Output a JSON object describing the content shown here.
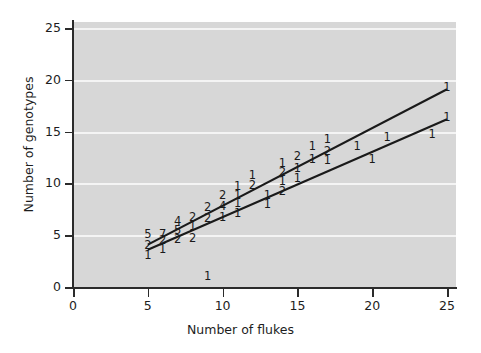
{
  "chart_data": {
    "type": "scatter",
    "title": "",
    "xlabel": "Number of flukes",
    "ylabel": "Number of genotypes",
    "xlim": [
      0,
      25.6
    ],
    "ylim": [
      0,
      25.6
    ],
    "xticks": [
      "0",
      "5",
      "10",
      "15",
      "20",
      "25"
    ],
    "yticks": [
      "0",
      "5",
      "10",
      "15",
      "20",
      "25"
    ],
    "xtick_values": [
      0,
      5,
      10,
      15,
      20,
      25
    ],
    "ytick_values": [
      0,
      5,
      10,
      15,
      20,
      25
    ],
    "grid": "horizontal-white-gridlines",
    "legend": "none",
    "panel_color": "#d7d7d7",
    "gridline_color": "#f4f4f4",
    "line_color": "#1a1a1a",
    "marker_style": "digit-count-labels",
    "note": "Each plotted marker is a digit giving the number of overlapping observations at that coordinate.",
    "points": [
      {
        "x": 5,
        "y": 5,
        "label": "5"
      },
      {
        "x": 5,
        "y": 4,
        "label": "2"
      },
      {
        "x": 5,
        "y": 3,
        "label": "1"
      },
      {
        "x": 6,
        "y": 5,
        "label": "7"
      },
      {
        "x": 6,
        "y": 4.4,
        "label": "2"
      },
      {
        "x": 6,
        "y": 3.6,
        "label": "1"
      },
      {
        "x": 7,
        "y": 6.3,
        "label": "4"
      },
      {
        "x": 7,
        "y": 5.4,
        "label": "5"
      },
      {
        "x": 7,
        "y": 4.5,
        "label": "2"
      },
      {
        "x": 8,
        "y": 6.7,
        "label": "2"
      },
      {
        "x": 8,
        "y": 5.8,
        "label": "1"
      },
      {
        "x": 8,
        "y": 4.6,
        "label": "2"
      },
      {
        "x": 9,
        "y": 7.6,
        "label": "2"
      },
      {
        "x": 9,
        "y": 6.6,
        "label": "2"
      },
      {
        "x": 9,
        "y": 1,
        "label": "1"
      },
      {
        "x": 10,
        "y": 8.8,
        "label": "2"
      },
      {
        "x": 10,
        "y": 7.7,
        "label": "4"
      },
      {
        "x": 10,
        "y": 6.7,
        "label": "1"
      },
      {
        "x": 11,
        "y": 9.7,
        "label": "1"
      },
      {
        "x": 11,
        "y": 8.8,
        "label": "1"
      },
      {
        "x": 11,
        "y": 8.0,
        "label": "1"
      },
      {
        "x": 11,
        "y": 7.1,
        "label": "1"
      },
      {
        "x": 12,
        "y": 10.7,
        "label": "1"
      },
      {
        "x": 12,
        "y": 9.8,
        "label": "2"
      },
      {
        "x": 13,
        "y": 8.8,
        "label": "1"
      },
      {
        "x": 13,
        "y": 7.9,
        "label": "1"
      },
      {
        "x": 14,
        "y": 11.9,
        "label": "1"
      },
      {
        "x": 14,
        "y": 11.0,
        "label": "2"
      },
      {
        "x": 14,
        "y": 10.1,
        "label": "1"
      },
      {
        "x": 14,
        "y": 9.2,
        "label": "2"
      },
      {
        "x": 15,
        "y": 12.6,
        "label": "2"
      },
      {
        "x": 15,
        "y": 11.4,
        "label": "1"
      },
      {
        "x": 15,
        "y": 10.4,
        "label": "1"
      },
      {
        "x": 16,
        "y": 13.5,
        "label": "1"
      },
      {
        "x": 16,
        "y": 12.3,
        "label": "1"
      },
      {
        "x": 17,
        "y": 14.2,
        "label": "1"
      },
      {
        "x": 17,
        "y": 13.0,
        "label": "2"
      },
      {
        "x": 17,
        "y": 12.2,
        "label": "1"
      },
      {
        "x": 19,
        "y": 13.5,
        "label": "1"
      },
      {
        "x": 20,
        "y": 12.3,
        "label": "1"
      },
      {
        "x": 21,
        "y": 14.4,
        "label": "1"
      },
      {
        "x": 24,
        "y": 14.7,
        "label": "1"
      },
      {
        "x": 25,
        "y": 19.2,
        "label": "1"
      },
      {
        "x": 25,
        "y": 16.3,
        "label": "1"
      }
    ],
    "fit_lines": [
      {
        "name": "upper-regression-line",
        "x1": 5,
        "y1": 4.1,
        "x2": 25,
        "y2": 19.1
      },
      {
        "name": "lower-regression-line",
        "x1": 5,
        "y1": 3.6,
        "x2": 25,
        "y2": 16.2
      }
    ]
  }
}
